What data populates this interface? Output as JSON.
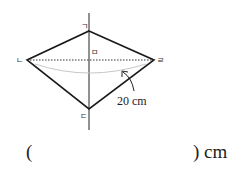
{
  "diagram": {
    "vertices": {
      "top": "ㄱ",
      "left": "ㄴ",
      "bottom": "ㄷ",
      "right": "ㄹ",
      "center": "ㅁ"
    },
    "measurement_label": "20 cm",
    "colors": {
      "line": "#1a1a1a",
      "dotted": "#333333",
      "arc": "#c8c8c8"
    }
  },
  "answer": {
    "open_paren": "(",
    "close_paren_unit": ") cm"
  }
}
